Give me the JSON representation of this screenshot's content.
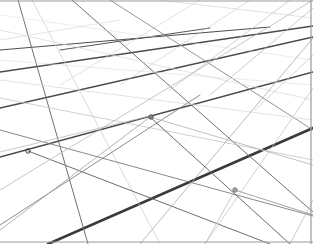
{
  "image": {
    "width": 313,
    "height": 244,
    "background": "#ffffff",
    "description": "Perspective grid of intersecting lines receding to upper right"
  },
  "frame": {
    "color": "#9a9a9a",
    "top_y": 1,
    "bottom_y": 242,
    "right_x": 311
  },
  "lines": [
    {
      "x1": 48,
      "y1": 244,
      "x2": 313,
      "y2": 128,
      "stroke": "#3a3a3a",
      "width": 2.6
    },
    {
      "x1": 0,
      "y1": 157,
      "x2": 313,
      "y2": 72,
      "stroke": "#4a4a4a",
      "width": 1.6
    },
    {
      "x1": 0,
      "y1": 108,
      "x2": 313,
      "y2": 37,
      "stroke": "#4a4a4a",
      "width": 1.4
    },
    {
      "x1": 0,
      "y1": 72,
      "x2": 313,
      "y2": 26,
      "stroke": "#4a4a4a",
      "width": 1.3
    },
    {
      "x1": 0,
      "y1": 50,
      "x2": 270,
      "y2": 27,
      "stroke": "#4d4d4d",
      "width": 1.2
    },
    {
      "x1": 60,
      "y1": 50,
      "x2": 210,
      "y2": 28,
      "stroke": "#555555",
      "width": 1.0
    },
    {
      "x1": 18,
      "y1": 0,
      "x2": 88,
      "y2": 244,
      "stroke": "#707070",
      "width": 1.0
    },
    {
      "x1": 32,
      "y1": 0,
      "x2": 160,
      "y2": 244,
      "stroke": "#d0d0d0",
      "width": 0.8
    },
    {
      "x1": 72,
      "y1": 0,
      "x2": 313,
      "y2": 212,
      "stroke": "#707070",
      "width": 1.0
    },
    {
      "x1": 110,
      "y1": 0,
      "x2": 313,
      "y2": 130,
      "stroke": "#888888",
      "width": 0.9
    },
    {
      "x1": 0,
      "y1": 130,
      "x2": 313,
      "y2": 216,
      "stroke": "#7a7a7a",
      "width": 0.9
    },
    {
      "x1": 0,
      "y1": 98,
      "x2": 313,
      "y2": 160,
      "stroke": "#c4c4c4",
      "width": 0.8
    },
    {
      "x1": 0,
      "y1": 80,
      "x2": 313,
      "y2": 120,
      "stroke": "#d6d6d6",
      "width": 0.7
    },
    {
      "x1": 0,
      "y1": 30,
      "x2": 313,
      "y2": 100,
      "stroke": "#d9d9d9",
      "width": 0.7
    },
    {
      "x1": 0,
      "y1": 15,
      "x2": 313,
      "y2": 60,
      "stroke": "#e0e0e0",
      "width": 0.6
    },
    {
      "x1": 0,
      "y1": 152,
      "x2": 150,
      "y2": 116,
      "stroke": "#bdbdbd",
      "width": 0.8
    },
    {
      "x1": 28,
      "y1": 151,
      "x2": 270,
      "y2": 244,
      "stroke": "#6e6e6e",
      "width": 1.0
    },
    {
      "x1": 0,
      "y1": 225,
      "x2": 200,
      "y2": 95,
      "stroke": "#808080",
      "width": 0.9
    },
    {
      "x1": 0,
      "y1": 190,
      "x2": 313,
      "y2": 0,
      "stroke": "#b8b8b8",
      "width": 0.8
    },
    {
      "x1": 140,
      "y1": 244,
      "x2": 313,
      "y2": 38,
      "stroke": "#a8a8a8",
      "width": 0.8
    },
    {
      "x1": 205,
      "y1": 244,
      "x2": 313,
      "y2": 88,
      "stroke": "#c8c8c8",
      "width": 0.8
    },
    {
      "x1": 290,
      "y1": 244,
      "x2": 313,
      "y2": 200,
      "stroke": "#bcbcbc",
      "width": 0.8
    },
    {
      "x1": 150,
      "y1": 117,
      "x2": 290,
      "y2": 244,
      "stroke": "#6a6a6a",
      "width": 1.0
    },
    {
      "x1": 150,
      "y1": 117,
      "x2": 0,
      "y2": 230,
      "stroke": "#a0a0a0",
      "width": 0.8
    },
    {
      "x1": 235,
      "y1": 190,
      "x2": 313,
      "y2": 215,
      "stroke": "#8a8a8a",
      "width": 0.8
    },
    {
      "x1": 235,
      "y1": 190,
      "x2": 205,
      "y2": 244,
      "stroke": "#c0c0c0",
      "width": 0.8
    },
    {
      "x1": 150,
      "y1": 117,
      "x2": 313,
      "y2": 165,
      "stroke": "#b0b0b0",
      "width": 0.8
    },
    {
      "x1": 160,
      "y1": 0,
      "x2": 313,
      "y2": 18,
      "stroke": "#cfcfcf",
      "width": 0.6
    },
    {
      "x1": 200,
      "y1": 0,
      "x2": 60,
      "y2": 85,
      "stroke": "#cfcfcf",
      "width": 0.6
    },
    {
      "x1": 250,
      "y1": 0,
      "x2": 120,
      "y2": 85,
      "stroke": "#c8c8c8",
      "width": 0.6
    },
    {
      "x1": 290,
      "y1": 0,
      "x2": 170,
      "y2": 90,
      "stroke": "#bdbdbd",
      "width": 0.7
    },
    {
      "x1": 313,
      "y1": 8,
      "x2": 210,
      "y2": 95,
      "stroke": "#b5b5b5",
      "width": 0.7
    },
    {
      "x1": 313,
      "y1": 55,
      "x2": 255,
      "y2": 110,
      "stroke": "#c6c6c6",
      "width": 0.7
    },
    {
      "x1": 0,
      "y1": 40,
      "x2": 120,
      "y2": 20,
      "stroke": "#d4d4d4",
      "width": 0.6
    },
    {
      "x1": 0,
      "y1": 60,
      "x2": 313,
      "y2": 85,
      "stroke": "#dddddd",
      "width": 0.6
    }
  ],
  "nodes": [
    {
      "cx": 28,
      "cy": 151,
      "r": 2.2,
      "stroke": "#3a3a3a",
      "fill": "none"
    },
    {
      "cx": 151,
      "cy": 117,
      "r": 2.2,
      "stroke": "#555555",
      "fill": "#888888"
    },
    {
      "cx": 235,
      "cy": 190,
      "r": 2.2,
      "stroke": "#777777",
      "fill": "#aaaaaa"
    }
  ]
}
